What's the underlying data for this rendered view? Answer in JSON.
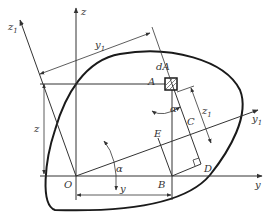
{
  "diagram": {
    "type": "coordinate-rotation-figure",
    "labels": {
      "origin": "O",
      "y_axis": "y",
      "z_axis": "z",
      "y1_axis": "y",
      "y1_sub": "1",
      "z1_axis": "z",
      "z1_sub": "1",
      "element": "dA",
      "point_A": "A",
      "point_B": "B",
      "point_C": "C",
      "point_D": "D",
      "point_E": "E",
      "angle_alpha": "α",
      "angle_alpha_at_A": "α",
      "dim_y": "y",
      "dim_z": "z",
      "dim_y1": "y",
      "dim_y1_sub": "1",
      "dim_z1": "z",
      "dim_z1_sub": "1"
    },
    "colors": {
      "line": "#333333",
      "outline": "#1a1a1a",
      "background": "#ffffff"
    }
  }
}
